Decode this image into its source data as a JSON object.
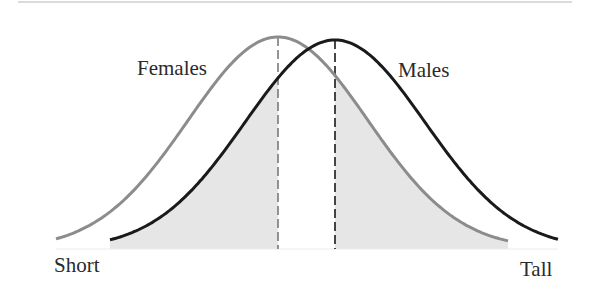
{
  "chart_data": {
    "type": "line",
    "title": "",
    "xlabel_left": "Short",
    "xlabel_right": "Tall",
    "ylabel": "",
    "grid": false,
    "legend": "inline labels",
    "series": [
      {
        "name": "Females",
        "color": "#8c8c8c",
        "distribution": "normal",
        "mean_px": 278,
        "sd_px": 90,
        "x_start_px": 56,
        "x_end_px": 508,
        "peak_y_px": 37
      },
      {
        "name": "Males",
        "color": "#1a1a1a",
        "distribution": "normal",
        "mean_px": 335,
        "sd_px": 90,
        "x_start_px": 110,
        "x_end_px": 558,
        "peak_y_px": 40
      }
    ],
    "mean_lines": [
      {
        "series": "Females",
        "x_px": 278,
        "style": "dashed"
      },
      {
        "series": "Males",
        "x_px": 335,
        "style": "dashed"
      }
    ],
    "shaded_regions": [
      {
        "description": "Males shorter than female mean",
        "under": "Males",
        "from": "start",
        "to_mean_of": "Females"
      },
      {
        "description": "Females taller than male mean",
        "under": "Females",
        "from_mean_of": "Males",
        "to": "end"
      }
    ],
    "baseline_y_px": 249,
    "shade_color": "#e6e6e6"
  },
  "labels": {
    "females": "Females",
    "males": "Males",
    "short": "Short",
    "tall": "Tall"
  }
}
